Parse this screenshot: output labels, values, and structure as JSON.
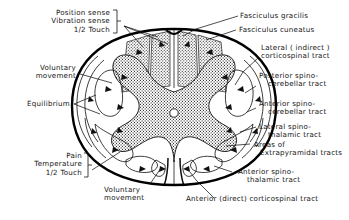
{
  "figure": {
    "kind": "anatomical-diagram",
    "background": "#ffffff",
    "ink": "#141414"
  },
  "labels": {
    "position_sense_group": {
      "line1": "Position sense",
      "line2": "Vibration sense",
      "line3_frac": "1/2",
      "line3_rest": "Touch"
    },
    "voluntary_movement_left": {
      "line1": "Voluntary",
      "line2": "movement"
    },
    "equilibrium": "Equilibrium",
    "pain_group": {
      "line1": "Pain",
      "line2": "Temperature",
      "line3_frac": "1/2",
      "line3_rest": "Touch"
    },
    "voluntary_movement_bottom": {
      "line1": "Voluntary",
      "line2": "movement"
    },
    "fasciculus_gracilis": "Fasciculus gracilis",
    "fasciculus_cuneatus": "Fasciculus cuneatus",
    "lateral_corticospinal": {
      "line1": "Lateral ( indirect )",
      "line2": "corticospinal tract"
    },
    "posterior_spinocerebellar": {
      "line1": "Posterior spino-",
      "line2": "cerebellar tract"
    },
    "anterior_spinocerebellar": {
      "line1": "Anterior spino-",
      "line2": "cerebellar tract"
    },
    "lateral_spinothalamic": {
      "line1": "Lateral spino-",
      "line2": "thalamic tract"
    },
    "extrapyramidal": {
      "line1": "Areas of",
      "line2": "Extrapyramidal tracts"
    },
    "anterior_spinothalamic": {
      "line1": "Anterior spino-",
      "line2": "thalamic tract"
    },
    "anterior_corticospinal": "Anterior (direct) corticospinal tract"
  },
  "colors": {
    "ink": "#141414",
    "outline": "#000000",
    "stipple": "#2a2a2a",
    "paper": "#ffffff"
  }
}
